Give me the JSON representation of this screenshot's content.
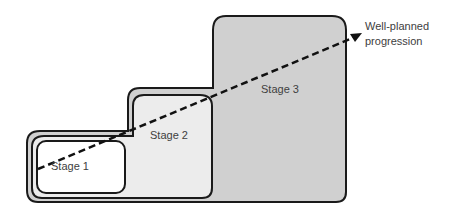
{
  "diagram": {
    "stages": [
      {
        "label": "Stage 1",
        "fill": "#ffffff"
      },
      {
        "label": "Stage 2",
        "fill": "#ececec"
      },
      {
        "label": "Stage 3",
        "fill": "#d0d0d0"
      }
    ],
    "arrow": {
      "style": "dashed",
      "label_line1": "Well-planned",
      "label_line2": "progression"
    },
    "colors": {
      "outline": "#1a1a1a",
      "text": "#404040"
    }
  }
}
